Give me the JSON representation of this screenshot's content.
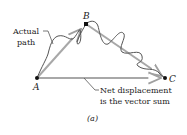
{
  "diagram": {
    "points": {
      "A": {
        "label": "A",
        "x": 37,
        "y": 78
      },
      "B": {
        "label": "B",
        "x": 86,
        "y": 24
      },
      "C": {
        "label": "C",
        "x": 165,
        "y": 78
      }
    },
    "annotations": {
      "actual_path_line1": "Actual",
      "actual_path_line2": "path",
      "net_line1": "Net displacement",
      "net_line2": "is the vector sum"
    },
    "caption": "(a)",
    "colors": {
      "vector": "#a8a8a8",
      "path": "#555555",
      "point": "#111111",
      "text": "#222222"
    }
  }
}
